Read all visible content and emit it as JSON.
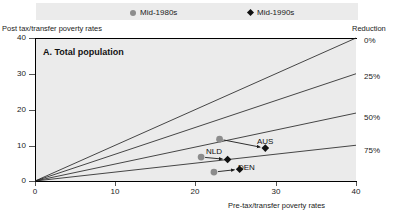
{
  "legend": {
    "items": [
      {
        "label": "Mid-1980s",
        "marker": "circle-marker-icon",
        "color": "#8c8c8c"
      },
      {
        "label": "Mid-1990s",
        "marker": "diamond-marker-icon",
        "color": "#111111"
      }
    ]
  },
  "axis_captions": {
    "y_title": "Post tax/transfer poverty rates",
    "x_title": "Pre-tax/transfer poverty rates",
    "reduction_title": "Reduction"
  },
  "panel": {
    "title": "A.  Total population"
  },
  "chart_data": {
    "type": "scatter",
    "title": "A.  Total population",
    "xlabel": "Pre-tax/transfer poverty rates",
    "ylabel": "Post tax/transfer poverty rates",
    "xlim": [
      0,
      40
    ],
    "ylim": [
      0,
      40
    ],
    "xticks": [
      0,
      10,
      20,
      30,
      40
    ],
    "yticks": [
      0,
      10,
      20,
      30,
      40
    ],
    "grid": false,
    "legend_position": "top",
    "reduction_lines": [
      {
        "label": "0%",
        "slope": 1.0,
        "end_x": 40,
        "end_y": 40
      },
      {
        "label": "25%",
        "slope": 0.75,
        "end_x": 40,
        "end_y": 30
      },
      {
        "label": "50%",
        "slope": 0.475,
        "end_x": 40,
        "end_y": 19
      },
      {
        "label": "75%",
        "slope": 0.25,
        "end_x": 40,
        "end_y": 10
      }
    ],
    "series": [
      {
        "name": "Mid-1980s",
        "marker": "circle",
        "color": "#8c8c8c",
        "points": [
          {
            "country": "AUS",
            "x": 23.0,
            "y": 11.7
          },
          {
            "country": "NLD",
            "x": 20.7,
            "y": 6.7
          },
          {
            "country": "DEN",
            "x": 22.3,
            "y": 2.5
          }
        ]
      },
      {
        "name": "Mid-1990s",
        "marker": "diamond",
        "color": "#111111",
        "points": [
          {
            "country": "AUS",
            "x": 28.7,
            "y": 9.2
          },
          {
            "country": "NLD",
            "x": 24.0,
            "y": 6.0
          },
          {
            "country": "DEN",
            "x": 25.5,
            "y": 3.3
          }
        ]
      }
    ],
    "annotations": [
      {
        "label": "AUS",
        "x": 29.5,
        "y": 11.0
      },
      {
        "label": "NLD",
        "x": 23.0,
        "y": 7.9
      },
      {
        "label": "DEN",
        "x": 27.0,
        "y": 3.4
      }
    ]
  }
}
